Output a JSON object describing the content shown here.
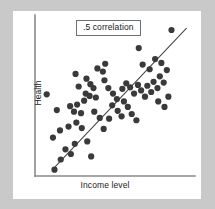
{
  "figure": {
    "background_color": "#c9c9c9",
    "card_color": "#ffffff",
    "annotation_label": ".5 correlation"
  },
  "chart_data": {
    "type": "scatter",
    "title": "",
    "subtitle": "",
    "xlabel": "Income level",
    "ylabel": "Health",
    "xlim": [
      0,
      100
    ],
    "ylim": [
      0,
      100
    ],
    "grid": false,
    "legend": null,
    "axis_ticks": {
      "x": [],
      "y": []
    },
    "annotations": [
      {
        "text": ".5 correlation",
        "x": 45,
        "y": 94,
        "boxed": true
      }
    ],
    "point_color": "#3a3a3a",
    "point_size": 3.1,
    "trend_line": {
      "label": "regression line",
      "color": "#4a4a4a",
      "x_start": 13,
      "y_start": 6,
      "x_end": 97,
      "y_end": 94
    },
    "correlation": 0.5,
    "n_points": 68,
    "points": [
      {
        "x": 12.5,
        "y": 4.0
      },
      {
        "x": 16.5,
        "y": 10.5
      },
      {
        "x": 19.5,
        "y": 17.0
      },
      {
        "x": 23.0,
        "y": 14.0
      },
      {
        "x": 25.5,
        "y": 20.5
      },
      {
        "x": 11.5,
        "y": 24.5
      },
      {
        "x": 16.0,
        "y": 29.0
      },
      {
        "x": 21.5,
        "y": 31.5
      },
      {
        "x": 26.5,
        "y": 34.0
      },
      {
        "x": 30.0,
        "y": 30.5
      },
      {
        "x": 33.5,
        "y": 22.0
      },
      {
        "x": 36.0,
        "y": 12.5
      },
      {
        "x": 7.5,
        "y": 52.0
      },
      {
        "x": 14.0,
        "y": 42.0
      },
      {
        "x": 22.5,
        "y": 44.5
      },
      {
        "x": 25.0,
        "y": 41.0
      },
      {
        "x": 27.0,
        "y": 45.5
      },
      {
        "x": 29.5,
        "y": 40.0
      },
      {
        "x": 31.5,
        "y": 48.0
      },
      {
        "x": 32.5,
        "y": 52.5
      },
      {
        "x": 35.0,
        "y": 51.0
      },
      {
        "x": 37.5,
        "y": 56.0
      },
      {
        "x": 39.0,
        "y": 50.0
      },
      {
        "x": 38.0,
        "y": 41.0
      },
      {
        "x": 41.5,
        "y": 37.0
      },
      {
        "x": 44.0,
        "y": 30.0
      },
      {
        "x": 47.5,
        "y": 36.5
      },
      {
        "x": 33.0,
        "y": 62.0
      },
      {
        "x": 35.5,
        "y": 58.5
      },
      {
        "x": 28.0,
        "y": 57.0
      },
      {
        "x": 26.0,
        "y": 65.0
      },
      {
        "x": 40.0,
        "y": 68.5
      },
      {
        "x": 43.5,
        "y": 66.5
      },
      {
        "x": 45.0,
        "y": 71.5
      },
      {
        "x": 44.5,
        "y": 61.0
      },
      {
        "x": 47.0,
        "y": 56.0
      },
      {
        "x": 50.0,
        "y": 52.5
      },
      {
        "x": 52.5,
        "y": 49.0
      },
      {
        "x": 49.5,
        "y": 45.0
      },
      {
        "x": 53.0,
        "y": 41.5
      },
      {
        "x": 55.5,
        "y": 38.0
      },
      {
        "x": 57.0,
        "y": 47.5
      },
      {
        "x": 59.5,
        "y": 44.0
      },
      {
        "x": 62.0,
        "y": 39.5
      },
      {
        "x": 65.0,
        "y": 35.5
      },
      {
        "x": 56.0,
        "y": 55.5
      },
      {
        "x": 58.5,
        "y": 59.0
      },
      {
        "x": 61.0,
        "y": 56.5
      },
      {
        "x": 63.5,
        "y": 52.5
      },
      {
        "x": 66.0,
        "y": 58.0
      },
      {
        "x": 68.0,
        "y": 54.5
      },
      {
        "x": 70.5,
        "y": 50.5
      },
      {
        "x": 72.0,
        "y": 57.5
      },
      {
        "x": 74.5,
        "y": 53.5
      },
      {
        "x": 76.0,
        "y": 60.0
      },
      {
        "x": 78.5,
        "y": 56.0
      },
      {
        "x": 80.0,
        "y": 63.5
      },
      {
        "x": 82.5,
        "y": 59.5
      },
      {
        "x": 79.0,
        "y": 47.5
      },
      {
        "x": 83.0,
        "y": 44.0
      },
      {
        "x": 85.5,
        "y": 50.5
      },
      {
        "x": 69.0,
        "y": 71.0
      },
      {
        "x": 73.5,
        "y": 68.0
      },
      {
        "x": 77.0,
        "y": 74.5
      },
      {
        "x": 81.0,
        "y": 72.0
      },
      {
        "x": 84.5,
        "y": 67.5
      },
      {
        "x": 66.5,
        "y": 81.5
      },
      {
        "x": 87.5,
        "y": 93.0
      }
    ]
  },
  "labels": {
    "y_axis": "Health",
    "x_axis": "Income level"
  }
}
